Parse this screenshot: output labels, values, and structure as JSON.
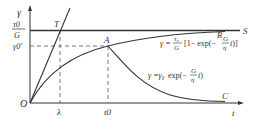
{
  "diagram": {
    "axes": {
      "y_label": "γ",
      "x_label": "t",
      "origin_label": "O"
    },
    "y_ticks": {
      "tau_over_G_num": "τ0",
      "tau_over_G_den": "G",
      "gamma0_prime": "γ0′"
    },
    "x_ticks": {
      "lambda": "λ",
      "t0": "t0"
    },
    "points": {
      "T": "T",
      "A": "A",
      "B": "B",
      "C": "C",
      "S": "S"
    },
    "equations": {
      "loading_curve": "γ = (τ0/G)[1 − exp(−(G/η)t)]",
      "relaxation_curve": "γ = γ0 exp(−(G/η)t)"
    },
    "colors": {
      "line": "#333333",
      "dashed": "#555555",
      "background": "#ffffff"
    }
  }
}
